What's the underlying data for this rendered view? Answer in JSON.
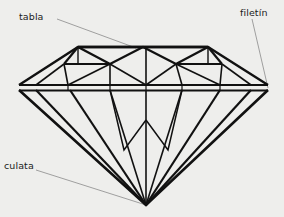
{
  "figure": {
    "name": "brillante-cut-diamond-diagram",
    "background_color": "#eeeeec",
    "line_color": "#111111",
    "leader_color": "#8a8a8a",
    "width": 284,
    "height": 217
  },
  "labels": {
    "table": {
      "text": "tabla",
      "leader": {
        "x1": 57,
        "y1": 19,
        "x2": 136,
        "y2": 48
      }
    },
    "girdle": {
      "text": "filetín",
      "leader": {
        "x1": 252,
        "y1": 19,
        "x2": 268,
        "y2": 88
      }
    },
    "culet": {
      "text": "culata",
      "leader": {
        "x1": 36,
        "y1": 170,
        "x2": 146,
        "y2": 205
      }
    }
  },
  "diamond": {
    "crown": {
      "table_facet": {
        "points": "78,47 208,47 208,63 78,63",
        "description": "top flat table facet of the crown"
      },
      "table_top_line": {
        "x1": 78,
        "y1": 47,
        "x2": 208,
        "y2": 47
      },
      "girdle_top_line": {
        "x1": 19,
        "y1": 82,
        "x2": 268,
        "y2": 82
      },
      "girdle_bottom_line": {
        "x1": 19,
        "y1": 90,
        "x2": 268,
        "y2": 90
      },
      "left_tip": {
        "x": 19,
        "y": 86
      },
      "right_tip": {
        "x": 268,
        "y": 86
      },
      "star_facet_lines": [
        "78,47 110,63",
        "110,63 143,47",
        "143,47 176,63",
        "176,63 208,47",
        "78,47 64,63",
        "208,47 222,63"
      ],
      "bezel_lines": [
        "19,86 78,47",
        "268,86 208,47",
        "64,63 19,86",
        "222,63 268,86",
        "110,63 68,82",
        "176,63 219,82",
        "110,63 143,82",
        "176,63 143,82",
        "64,63 110,63",
        "222,63 176,63",
        "64,63 68,82",
        "222,63 219,82",
        "110,63 110,82",
        "176,63 176,82",
        "143,47 143,82"
      ],
      "upper_girdle_lines": [
        "19,86 68,82",
        "68,82 110,82",
        "110,82 143,82",
        "143,82 176,82",
        "176,82 219,82",
        "219,82 268,86"
      ]
    },
    "pavilion": {
      "culet": {
        "x": 146,
        "y": 205
      },
      "main_lines": [
        "19,90 146,205",
        "268,90 146,205",
        "36,90 146,205",
        "251,90 146,205",
        "70,90 146,205",
        "220,90 146,205",
        "110,90 146,205",
        "182,90 146,205",
        "146,90 146,205"
      ],
      "lower_girdle_lines": [
        "110,90 124,148",
        "124,148 146,118",
        "182,90 168,148",
        "168,148 146,118"
      ]
    }
  }
}
